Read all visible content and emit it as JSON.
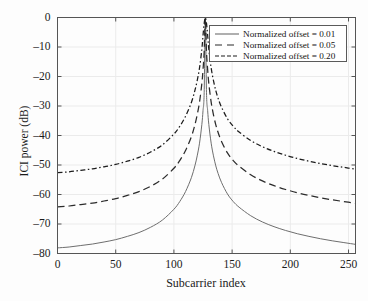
{
  "chart_data": {
    "type": "line",
    "title": "",
    "xlabel": "Subcarrier index",
    "ylabel": "ICI power (dB)",
    "xlim": [
      0,
      256
    ],
    "ylim": [
      -80,
      0
    ],
    "xticks": [
      0,
      50,
      100,
      150,
      200,
      250
    ],
    "xtick_labels": [
      "0",
      "50",
      "100",
      "150",
      "200",
      "250"
    ],
    "yticks": [
      0,
      -10,
      -20,
      -30,
      -40,
      -50,
      -60,
      -70,
      -80
    ],
    "ytick_labels": [
      "0",
      "–10",
      "–20",
      "–30",
      "–40",
      "–50",
      "–60",
      "–70",
      "–80"
    ],
    "grid": true,
    "legend_position": "upper right",
    "peak_index": 127,
    "series": [
      {
        "name": "Normalized offset = 0.01",
        "offset": 0.01,
        "style": "solid",
        "color": "#6e6e6e",
        "x": [
          0,
          10,
          20,
          30,
          40,
          50,
          60,
          70,
          80,
          90,
          100,
          105,
          110,
          115,
          118,
          120,
          122,
          124,
          125,
          126,
          127,
          128,
          129,
          130,
          132,
          134,
          136,
          138,
          141,
          146,
          151,
          156,
          166,
          176,
          186,
          196,
          206,
          216,
          226,
          236,
          246,
          256
        ],
        "y": [
          -78.1,
          -77.8,
          -77.3,
          -76.8,
          -76.1,
          -75.3,
          -74.2,
          -72.9,
          -71.1,
          -68.7,
          -65.0,
          -62.4,
          -59.0,
          -54.3,
          -50.3,
          -46.9,
          -42.6,
          -36.3,
          -31.6,
          -25.5,
          -0.1,
          -25.5,
          -31.6,
          -36.3,
          -42.6,
          -46.9,
          -50.3,
          -52.9,
          -56.0,
          -59.8,
          -62.4,
          -64.3,
          -67.2,
          -69.3,
          -70.9,
          -72.2,
          -73.3,
          -74.2,
          -75.0,
          -75.7,
          -76.3,
          -76.9
        ]
      },
      {
        "name": "Normalized offset = 0.05",
        "offset": 0.05,
        "style": "dashed",
        "color": "#2b2b2b",
        "x": [
          0,
          10,
          20,
          30,
          40,
          50,
          60,
          70,
          80,
          90,
          100,
          105,
          110,
          115,
          118,
          120,
          122,
          124,
          125,
          126,
          127,
          128,
          129,
          130,
          132,
          134,
          136,
          138,
          141,
          146,
          151,
          156,
          166,
          176,
          186,
          196,
          206,
          216,
          226,
          236,
          246,
          256
        ],
        "y": [
          -64.2,
          -63.9,
          -63.4,
          -62.9,
          -62.2,
          -61.4,
          -60.3,
          -59.0,
          -57.2,
          -54.8,
          -51.1,
          -48.5,
          -45.1,
          -40.4,
          -36.4,
          -33.0,
          -28.7,
          -22.4,
          -17.7,
          -11.6,
          -0.1,
          -11.6,
          -17.7,
          -22.4,
          -28.7,
          -33.0,
          -36.4,
          -39.0,
          -42.1,
          -45.9,
          -48.5,
          -50.4,
          -53.3,
          -55.4,
          -57.0,
          -58.3,
          -59.4,
          -60.3,
          -61.1,
          -61.8,
          -62.4,
          -63.0
        ]
      },
      {
        "name": "Normalized offset = 0.20",
        "offset": 0.2,
        "style": "dashdot",
        "color": "#1c1c1c",
        "x": [
          0,
          10,
          20,
          30,
          40,
          50,
          60,
          70,
          80,
          90,
          100,
          105,
          110,
          115,
          118,
          120,
          122,
          124,
          125,
          126,
          127,
          128,
          129,
          130,
          132,
          134,
          136,
          138,
          141,
          146,
          151,
          156,
          166,
          176,
          186,
          196,
          206,
          216,
          226,
          236,
          246,
          256
        ],
        "y": [
          -52.6,
          -52.3,
          -51.8,
          -51.3,
          -50.6,
          -49.8,
          -48.7,
          -47.4,
          -45.6,
          -43.2,
          -39.5,
          -36.9,
          -33.5,
          -28.8,
          -24.8,
          -21.4,
          -17.1,
          -10.8,
          -6.1,
          -2.0,
          -0.05,
          -2.0,
          -6.1,
          -10.8,
          -17.1,
          -21.4,
          -24.8,
          -27.4,
          -30.5,
          -34.3,
          -36.9,
          -38.8,
          -41.7,
          -43.8,
          -45.4,
          -46.7,
          -47.8,
          -48.7,
          -49.5,
          -50.2,
          -50.8,
          -51.4
        ]
      }
    ]
  },
  "axes": {
    "x_label": "Subcarrier index",
    "y_label": "ICI power (dB)"
  },
  "legend": {
    "entries": [
      {
        "label": "Normalized offset = 0.01",
        "style": "solid"
      },
      {
        "label": "Normalized offset = 0.05",
        "style": "dashed"
      },
      {
        "label": "Normalized offset = 0.20",
        "style": "dashdot"
      }
    ]
  },
  "colors": {
    "background": "#fdfdfd",
    "axis": "#555555",
    "grid": "#ebebeb",
    "series_solid": "#6e6e6e",
    "series_dashed": "#2b2b2b",
    "series_dashdot": "#1c1c1c"
  }
}
